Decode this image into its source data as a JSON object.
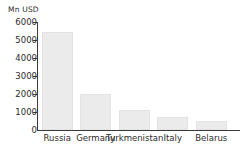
{
  "chart_data": {
    "type": "bar",
    "title": "",
    "subtitle": "",
    "xlabel": "",
    "ylabel": "Mn USD",
    "unit_label": "Mn USD",
    "categories": [
      "Russia",
      "Germany",
      "Turkmenistan",
      "Italy",
      "Belarus"
    ],
    "values": [
      5450,
      2020,
      1090,
      750,
      520
    ],
    "series": [
      {
        "name": "Mn USD",
        "values": [
          5450,
          2020,
          1090,
          750,
          520
        ]
      }
    ],
    "ylim": [
      0,
      6000
    ],
    "ytick_values": [
      6000,
      5000,
      4000,
      3000,
      2000,
      1000,
      0
    ],
    "ytick_labels": [
      "6000",
      "5000",
      "4000",
      "3000",
      "2000",
      "1000",
      "0"
    ],
    "grid": false,
    "legend": false,
    "legend_position": "none",
    "bar_color": "#ebebeb",
    "bar_border_color": "#e3e3e3",
    "axis_color": "#3a3a3a",
    "text_color": "#2b2b2b",
    "background_color": "#ffffff"
  }
}
